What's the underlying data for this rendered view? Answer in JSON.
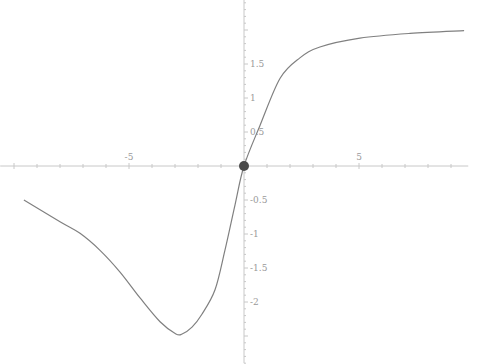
{
  "chart_data": {
    "type": "line",
    "title": "",
    "xlabel": "",
    "ylabel": "",
    "xlim": [
      -10.6,
      9.75
    ],
    "ylim": [
      -2.9,
      2.45
    ],
    "grid": false,
    "legend": null,
    "x_ticks": [
      -5,
      5
    ],
    "x_tick_labels": [
      "-5",
      "5"
    ],
    "y_ticks": [
      -2,
      -1.5,
      -1,
      -0.5,
      0.5,
      1,
      1.5
    ],
    "y_tick_labels": [
      "-2",
      "-1.5",
      "-1",
      "-0.5",
      "0.5",
      "1",
      "1.5"
    ],
    "series": [
      {
        "name": "f(x)",
        "color": "#808080",
        "x": [
          -9.57,
          -8.0,
          -7.13,
          -6.26,
          -5.39,
          -4.52,
          -3.65,
          -2.96,
          -2.69,
          -2.26,
          -1.83,
          -1.26,
          -0.83,
          -0.39,
          0.0,
          0.7,
          1.57,
          2.43,
          3.3,
          5.04,
          7.22,
          9.57
        ],
        "y": [
          -0.5,
          -0.82,
          -0.99,
          -1.24,
          -1.56,
          -1.94,
          -2.29,
          -2.47,
          -2.47,
          -2.37,
          -2.18,
          -1.82,
          -1.24,
          -0.57,
          0.0,
          0.6,
          1.29,
          1.59,
          1.75,
          1.88,
          1.95,
          1.99
        ]
      }
    ],
    "annotations": [
      {
        "type": "point",
        "x": 0,
        "y": 0,
        "color": "#4a4a4a"
      }
    ]
  },
  "axis_color": "#c8c8c8"
}
